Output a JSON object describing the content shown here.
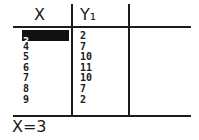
{
  "table": {
    "headers": [
      "X",
      "Y₁",
      ""
    ],
    "selected_cell": {
      "column": "X",
      "row": 0,
      "value": "3"
    },
    "rows": [
      {
        "x": "3",
        "y1": "2"
      },
      {
        "x": "4",
        "y1": "7"
      },
      {
        "x": "5",
        "y1": "10"
      },
      {
        "x": "6",
        "y1": "11"
      },
      {
        "x": "7",
        "y1": "10"
      },
      {
        "x": "8",
        "y1": "7"
      },
      {
        "x": "9",
        "y1": "2"
      }
    ]
  },
  "status": {
    "text": "X=3"
  },
  "colors": {
    "foreground": "#1c1c1c",
    "background": "#ffffff",
    "highlight": "#111111"
  }
}
